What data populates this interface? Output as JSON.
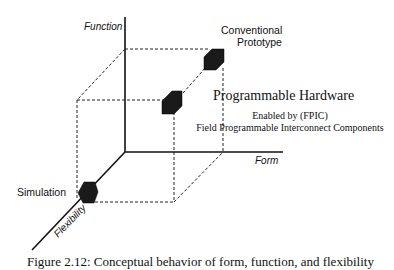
{
  "diagram": {
    "axes": {
      "function": "Function",
      "form": "Form",
      "flexibility": "Flexibility"
    },
    "points": [
      {
        "label_lines": [
          "Conventional",
          "Prototype"
        ],
        "position": "high function, high form, low flexibility"
      },
      {
        "label": "Programmable Hardware",
        "position": "mid function, mid form, mid flexibility"
      },
      {
        "label": "Simulation",
        "position": "high flexibility"
      }
    ],
    "programmable_hardware": {
      "title": "Programmable Hardware",
      "subtitle_line1": "Enabled by (FPIC)",
      "subtitle_line2": "Field Programmable Interconnect Components"
    },
    "simulation_label": "Simulation",
    "conventional_label_line1": "Conventional",
    "conventional_label_line2": "Prototype",
    "caption": "Figure 2.12: Conceptual behavior of form, function, and flexibility",
    "colors": {
      "lines": "#111111",
      "cube": "#1a1a1a",
      "background": "#ffffff"
    }
  }
}
